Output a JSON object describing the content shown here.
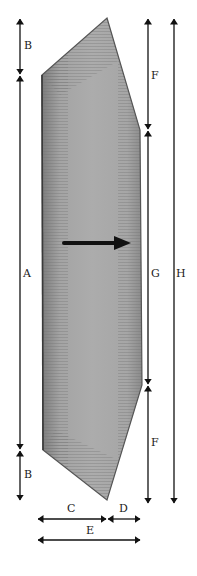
{
  "diagram": {
    "type": "dimensioned-shape",
    "shape": {
      "description": "elongated hexagonal plate with pointed top and bottom",
      "fill_color": "#a9a9a9",
      "edge_color": "#555555",
      "points": [
        [
          107,
          18
        ],
        [
          140,
          130
        ],
        [
          142,
          385
        ],
        [
          107,
          500
        ],
        [
          43,
          450
        ],
        [
          42,
          75
        ]
      ]
    },
    "direction_arrow": {
      "name": "direction-arrow",
      "x1": 64,
      "y1": 243,
      "x2": 130,
      "y2": 243,
      "color": "#111111"
    },
    "dimensions": [
      {
        "label": "B",
        "orientation": "vertical",
        "x": 20,
        "from": 18,
        "to": 75,
        "label_x": 24,
        "label_y": 40
      },
      {
        "label": "A",
        "orientation": "vertical",
        "x": 20,
        "from": 75,
        "to": 450,
        "label_x": 23,
        "label_y": 274
      },
      {
        "label": "B",
        "orientation": "vertical",
        "x": 20,
        "from": 450,
        "to": 500,
        "label_x": 24,
        "label_y": 469
      },
      {
        "label": "F",
        "orientation": "vertical",
        "x": 148,
        "from": 18,
        "to": 130,
        "label_x": 151,
        "label_y": 70
      },
      {
        "label": "G",
        "orientation": "vertical",
        "x": 148,
        "from": 130,
        "to": 385,
        "label_x": 151,
        "label_y": 274
      },
      {
        "label": "F",
        "orientation": "vertical",
        "x": 148,
        "from": 385,
        "to": 503,
        "label_x": 151,
        "label_y": 437
      },
      {
        "label": "H",
        "orientation": "vertical",
        "x": 174,
        "from": 18,
        "to": 503,
        "label_x": 177,
        "label_y": 274
      },
      {
        "label": "C",
        "orientation": "horizontal",
        "y": 519,
        "from": 38,
        "to": 106,
        "label_x": 67,
        "label_y": 503
      },
      {
        "label": "D",
        "orientation": "horizontal",
        "y": 519,
        "from": 108,
        "to": 140,
        "label_x": 119,
        "label_y": 503
      },
      {
        "label": "E",
        "orientation": "horizontal",
        "y": 540,
        "from": 38,
        "to": 140,
        "label_x": 86,
        "label_y": 524
      }
    ],
    "line_color": "#111111"
  },
  "labels": {
    "B_top": "B",
    "A": "A",
    "B_bottom": "B",
    "F_top": "F",
    "G": "G",
    "F_bottom": "F",
    "H": "H",
    "C": "C",
    "D": "D",
    "E": "E"
  }
}
